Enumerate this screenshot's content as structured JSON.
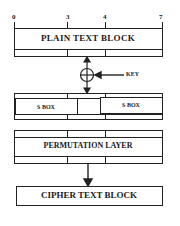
{
  "diagram": {
    "bit_ticks": [
      "0",
      "3",
      "4",
      "7"
    ],
    "plain_text_block": {
      "label": "PLAIN TEXT BLOCK"
    },
    "xor": {
      "symbol": "xor-circle-plus"
    },
    "key": {
      "label": "KEY"
    },
    "sbox_layer": {
      "boxes": [
        {
          "label": "S BOX"
        },
        {
          "label": "S BOX"
        }
      ]
    },
    "permutation_layer": {
      "label": "PERMUTATION LAYER"
    },
    "cipher_text_block": {
      "label": "CIPHER TEXT BLOCK"
    },
    "colors": {
      "line": "#222222",
      "background": "#ffffff"
    }
  }
}
